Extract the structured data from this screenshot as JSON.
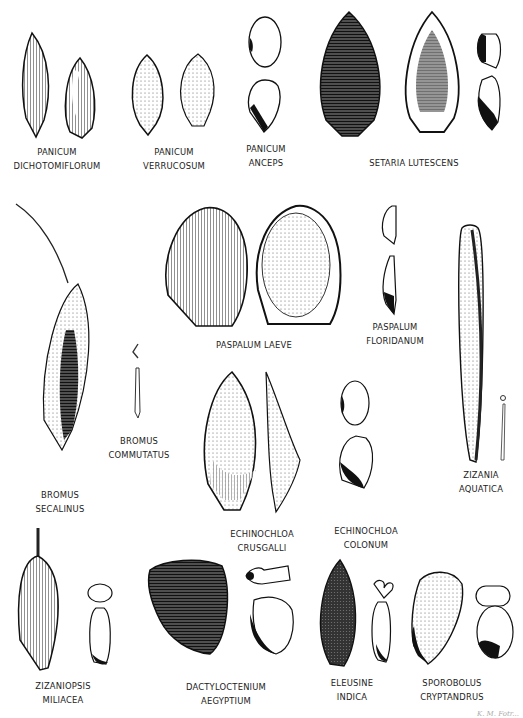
{
  "plate": {
    "type": "botanical illustration plate of grass seeds / spikelets",
    "specimens": [
      {
        "id": "panicum-dichotomiflorum",
        "line1": "PANICUM",
        "line2": "DICHOTOMIFLORUM"
      },
      {
        "id": "panicum-verrucosum",
        "line1": "PANICUM",
        "line2": "VERRUCOSUM"
      },
      {
        "id": "panicum-anceps",
        "line1": "PANICUM",
        "line2": "ANCEPS"
      },
      {
        "id": "setaria-lutescens",
        "line1": "SETARIA  LUTESCENS",
        "line2": ""
      },
      {
        "id": "bromus-secalinus",
        "line1": "BROMUS",
        "line2": "SECALINUS"
      },
      {
        "id": "bromus-commutatus",
        "line1": "BROMUS",
        "line2": "COMMUTATUS"
      },
      {
        "id": "paspalum-laeve",
        "line1": "PASPALUM  LAEVE",
        "line2": ""
      },
      {
        "id": "paspalum-floridanum",
        "line1": "PASPALUM",
        "line2": "FLORIDANUM"
      },
      {
        "id": "zizania-aquatica",
        "line1": "ZIZANIA",
        "line2": "AQUATICA"
      },
      {
        "id": "echinochloa-crusgalli",
        "line1": "ECHINOCHLOA",
        "line2": "CRUSGALLI"
      },
      {
        "id": "echinochloa-colonum",
        "line1": "ECHINOCHLOA",
        "line2": "COLONUM"
      },
      {
        "id": "zizaniopsis-miliacea",
        "line1": "ZIZANIOPSIS",
        "line2": "MILIACEA"
      },
      {
        "id": "dactyloctenium-aegyptium",
        "line1": "DACTYLOCTENIUM",
        "line2": "AEGYPTIUM"
      },
      {
        "id": "eleusine-indica",
        "line1": "ELEUSINE",
        "line2": "INDICA"
      },
      {
        "id": "sporobolus-cryptandrus",
        "line1": "SPOROBOLUS",
        "line2": "CRYPTANDRUS"
      }
    ],
    "signature": "K. M. Fotr..."
  },
  "colors": {
    "ink": "#1a1a1a",
    "paper": "#ffffff",
    "label": "#222222"
  }
}
